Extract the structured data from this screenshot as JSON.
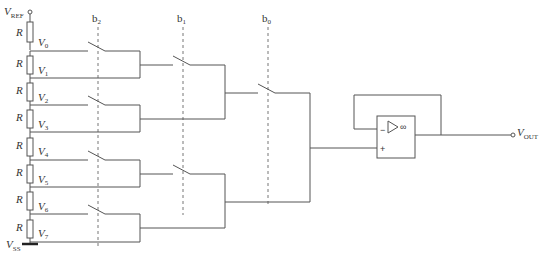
{
  "supply": {
    "top": {
      "main": "V",
      "sub": "REF"
    },
    "bottom": {
      "main": "V",
      "sub": "SS"
    }
  },
  "resistor_label": "R",
  "taps": [
    {
      "main": "V",
      "sub": "0"
    },
    {
      "main": "V",
      "sub": "1"
    },
    {
      "main": "V",
      "sub": "2"
    },
    {
      "main": "V",
      "sub": "3"
    },
    {
      "main": "V",
      "sub": "4"
    },
    {
      "main": "V",
      "sub": "5"
    },
    {
      "main": "V",
      "sub": "6"
    },
    {
      "main": "V",
      "sub": "7"
    }
  ],
  "control_bits": [
    {
      "main": "b",
      "sub": "2"
    },
    {
      "main": "b",
      "sub": "1"
    },
    {
      "main": "b",
      "sub": "0"
    }
  ],
  "opamp": {
    "minus": "−",
    "plus": "+",
    "gain_symbol": "∞"
  },
  "output": {
    "main": "V",
    "sub": "OUT"
  },
  "colors": {
    "wire": "#555555",
    "text": "#333333",
    "background": "#ffffff"
  }
}
